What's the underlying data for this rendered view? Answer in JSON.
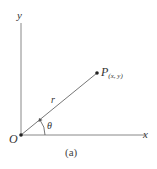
{
  "diagram": {
    "axes": {
      "x_label": "x",
      "y_label": "y",
      "origin_label": "O"
    },
    "point": {
      "name": "P",
      "subscript": "(x, y)"
    },
    "radius_label": "r",
    "angle_label": "θ",
    "caption": "(a)",
    "colors": {
      "line": "#777777",
      "text": "#333333",
      "point": "#222222"
    }
  }
}
